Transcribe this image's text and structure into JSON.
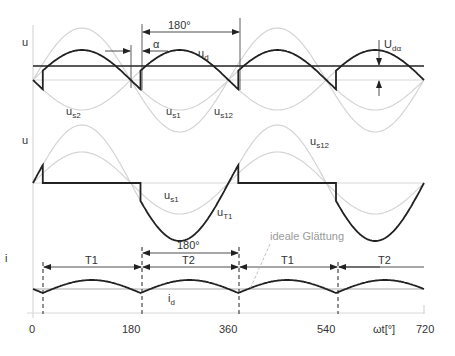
{
  "colors": {
    "main_curve": "#222222",
    "light_curve": "#d6d6d6",
    "axis": "#c8c8c8",
    "text": "#333333",
    "annotation_gray": "#9a9a9a"
  },
  "chart_data": {
    "type": "line",
    "title": "",
    "xlabel": "ωt[°]",
    "x_ticks": [
      "0",
      "180",
      "360",
      "540",
      "720"
    ],
    "xlim": [
      0,
      720
    ],
    "firing_angle_alpha_deg": 18,
    "panels": [
      {
        "name": "output-voltage",
        "ylabel": "u",
        "series": [
          {
            "name": "u_d",
            "style": "bold",
            "description": "rectified output voltage, thyristor firing delayed by α"
          },
          {
            "name": "u_s1",
            "style": "light"
          },
          {
            "name": "u_s2",
            "style": "light"
          },
          {
            "name": "u_s12",
            "style": "light"
          },
          {
            "name": "U_dα",
            "style": "bold-horizontal",
            "description": "mean DC voltage"
          }
        ],
        "annotations": [
          "180°",
          "α",
          "U_dα"
        ]
      },
      {
        "name": "thyristor-voltage",
        "ylabel": "u",
        "series": [
          {
            "name": "u_T1",
            "style": "bold"
          },
          {
            "name": "u_s1",
            "style": "light"
          },
          {
            "name": "u_s12",
            "style": "light"
          }
        ]
      },
      {
        "name": "current",
        "ylabel": "i",
        "series": [
          {
            "name": "i_d",
            "style": "bold"
          },
          {
            "name": "ideale Glättung",
            "style": "light-horizontal"
          }
        ],
        "conduction_intervals": [
          {
            "label": "T1",
            "from_deg": 18,
            "to_deg": 198
          },
          {
            "label": "T2",
            "from_deg": 198,
            "to_deg": 378
          },
          {
            "label": "T1",
            "from_deg": 378,
            "to_deg": 558
          },
          {
            "label": "T2",
            "from_deg": 558,
            "to_deg": 720
          }
        ],
        "annotations": [
          "180°",
          "ideale Glättung"
        ]
      }
    ]
  },
  "labels": {
    "top_u": "u",
    "mid_u": "u",
    "bot_i": "i",
    "deg180_top": "180°",
    "alpha": "α",
    "ud": "u",
    "ud_sub": "d",
    "udalpha": "U",
    "udalpha_sub": "dα",
    "us2": "u",
    "us2_sub": "s2",
    "us1_top": "u",
    "us1_top_sub": "s1",
    "us12_top": "u",
    "us12_top_sub": "s12",
    "us12_mid": "u",
    "us12_mid_sub": "s12",
    "us1_mid": "u",
    "us1_mid_sub": "s1",
    "ut1": "u",
    "ut1_sub": "T1",
    "ideale": "ideale Glättung",
    "deg180_bot": "180°",
    "t1a": "T1",
    "t2a": "T2",
    "t1b": "T1",
    "t2b": "T2",
    "id": "i",
    "id_sub": "d",
    "tick0": "0",
    "tick180": "180",
    "tick360": "360",
    "tick540": "540",
    "tick720": "720",
    "xlabel": "ωt[°]"
  }
}
